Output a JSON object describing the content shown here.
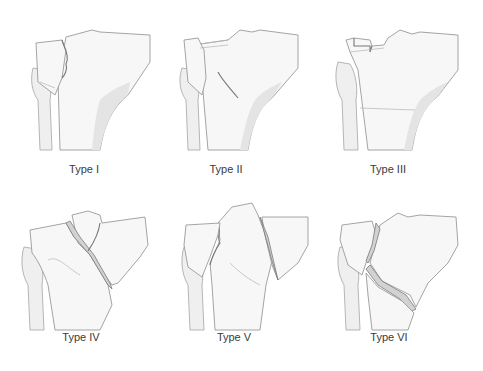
{
  "figure": {
    "panels": [
      {
        "id": "type-1",
        "label": "Type I"
      },
      {
        "id": "type-2",
        "label": "Type II"
      },
      {
        "id": "type-3",
        "label": "Type III"
      },
      {
        "id": "type-4",
        "label": "Type IV"
      },
      {
        "id": "type-5",
        "label": "Type V"
      },
      {
        "id": "type-6",
        "label": "Type VI"
      }
    ]
  },
  "colors": {
    "background": "#ffffff",
    "bone_fill": "#f7f7f7",
    "bone_outline": "#9a9a9a",
    "fracture_line": "#777777",
    "label_text": "#3a3a3a"
  }
}
